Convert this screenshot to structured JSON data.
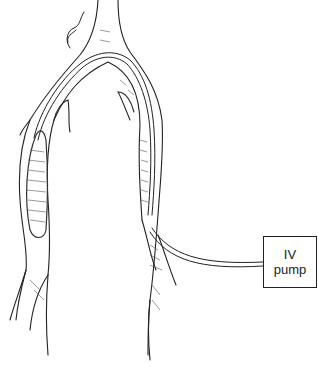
{
  "diagram": {
    "pump_box": {
      "line1": "IV",
      "line2": "pump"
    },
    "colors": {
      "line": "#222222",
      "hatch": "#555555",
      "background": "#ffffff"
    }
  }
}
